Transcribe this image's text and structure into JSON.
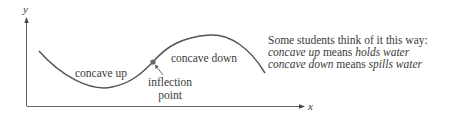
{
  "axes": {
    "y_label": "y",
    "x_label": "x",
    "axis_color": "#666666"
  },
  "curve": {
    "color": "#555555",
    "regions": {
      "concave_up_label": "concave up",
      "concave_down_label": "concave down"
    },
    "inflection_point": {
      "label_line1": "inflection",
      "label_line2": "point",
      "marker_color": "#666666"
    }
  },
  "note": {
    "heading": "Some students think of it this way:",
    "line1": {
      "term": "concave up",
      "connector": " means ",
      "meaning": "holds water"
    },
    "line2": {
      "term": "concave down",
      "connector": " means ",
      "meaning": "spills water"
    }
  }
}
